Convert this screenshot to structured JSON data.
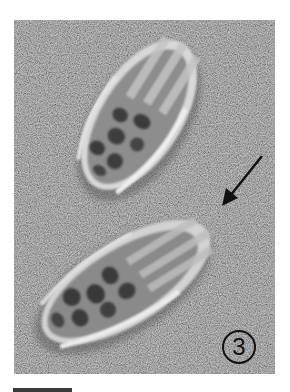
{
  "figure": {
    "panel_label": "3",
    "background_color": "#7b7b7b",
    "specimens": [
      {
        "name": "upper-specimen",
        "description": "tapered porous test with longitudinal ribs, upper"
      },
      {
        "name": "lower-specimen",
        "description": "tapered porous test with longitudinal ribs, lower"
      }
    ],
    "annotations": {
      "arrow": {
        "color": "#111111",
        "points_to": "apex of lower specimen"
      },
      "scale_bar": {
        "color": "#3a3a3a"
      }
    }
  }
}
